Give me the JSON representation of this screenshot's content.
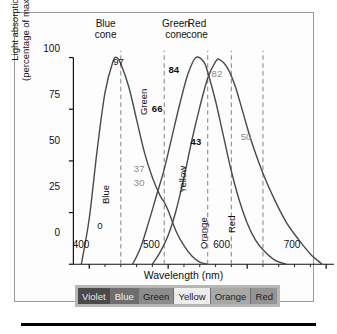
{
  "figure": {
    "background": "#fdfdfd",
    "border_color": "#9a9a9a"
  },
  "chart_data": {
    "type": "line",
    "title": "",
    "xlabel": "Wavelength (nm)",
    "ylabel": "Light absorption (percentage of maximum)",
    "ylabel_line1": "Light absorption",
    "ylabel_line2": "(percentage of maximum)",
    "xlim": [
      380,
      710
    ],
    "ylim": [
      0,
      100
    ],
    "xticks": [
      400,
      500,
      600,
      700
    ],
    "yticks": [
      0,
      25,
      50,
      75,
      100
    ],
    "grid": false,
    "legend": "none",
    "series": [
      {
        "name": "Blue cone",
        "label": "Blue cone",
        "label_line1": "Blue",
        "label_line2": "cone",
        "peak_x": 435,
        "peak_y": 100,
        "x": [
          390,
          400,
          410,
          420,
          430,
          435,
          440,
          450,
          460,
          470,
          480,
          490,
          495,
          500,
          510,
          520,
          530,
          540,
          550
        ],
        "y": [
          0,
          22,
          55,
          83,
          98,
          100,
          97,
          86,
          70,
          54,
          42,
          33,
          30,
          26,
          16,
          9,
          4,
          1,
          0
        ]
      },
      {
        "name": "Green cone",
        "label": "Green cone",
        "label_line1": "Green",
        "label_line2": "cone",
        "peak_x": 535,
        "peak_y": 100,
        "x": [
          455,
          465,
          475,
          485,
          495,
          505,
          515,
          525,
          535,
          545,
          550,
          560,
          570,
          580,
          590,
          600,
          610,
          620,
          635,
          650
        ],
        "y": [
          0,
          8,
          20,
          33,
          46,
          62,
          78,
          92,
          100,
          98,
          93,
          79,
          62,
          45,
          31,
          20,
          12,
          7,
          2,
          0
        ]
      },
      {
        "name": "Red cone",
        "label": "Red cone",
        "label_line1": "Red",
        "label_line2": "cone",
        "peak_x": 565,
        "peak_y": 99,
        "x": [
          480,
          490,
          500,
          510,
          520,
          530,
          540,
          550,
          560,
          565,
          575,
          585,
          595,
          605,
          620,
          635,
          650,
          665,
          680,
          695
        ],
        "y": [
          0,
          6,
          14,
          26,
          42,
          60,
          76,
          90,
          98,
          99,
          95,
          86,
          73,
          60,
          44,
          31,
          20,
          12,
          5,
          0
        ]
      }
    ],
    "marker_wavelengths": [
      440,
      495,
      550,
      580,
      620
    ],
    "annotations": [
      {
        "value": "97",
        "wavelength": 440,
        "absorption": 93,
        "style": "plain"
      },
      {
        "value": "0",
        "wavelength": 440,
        "absorption": 5,
        "style": "plain"
      },
      {
        "value": "66",
        "wavelength": 495,
        "absorption": 68,
        "style": "bold"
      },
      {
        "value": "37",
        "wavelength": 495,
        "absorption": 36,
        "style": "grey"
      },
      {
        "value": "30",
        "wavelength": 495,
        "absorption": 28,
        "style": "grey"
      },
      {
        "value": "84",
        "wavelength": 550,
        "absorption": 89,
        "style": "bold"
      },
      {
        "value": "82",
        "wavelength": 580,
        "absorption": 87,
        "style": "grey"
      },
      {
        "value": "43",
        "wavelength": 580,
        "absorption": 50,
        "style": "bold"
      },
      {
        "value": "50",
        "wavelength": 620,
        "absorption": 52,
        "style": "grey"
      }
    ],
    "inline_color_labels": [
      "Blue",
      "Green",
      "Yellow",
      "Orange",
      "Red"
    ]
  },
  "spectrum_bar": {
    "segments": [
      {
        "label": "Violet",
        "fill": "#4a4a4a",
        "text_color": "#e8e8e8"
      },
      {
        "label": "Blue",
        "fill": "#6e6e6e",
        "text_color": "#f2f2f2"
      },
      {
        "label": "Green",
        "fill": "#8c8c8c",
        "text_color": "#1c1c1c"
      },
      {
        "label": "Yellow",
        "fill": "#ededed",
        "text_color": "#1c1c1c"
      },
      {
        "label": "Orange",
        "fill": "#a8a8a8",
        "text_color": "#1c1c1c"
      },
      {
        "label": "Red",
        "fill": "#949494",
        "text_color": "#1c1c1c"
      }
    ]
  }
}
